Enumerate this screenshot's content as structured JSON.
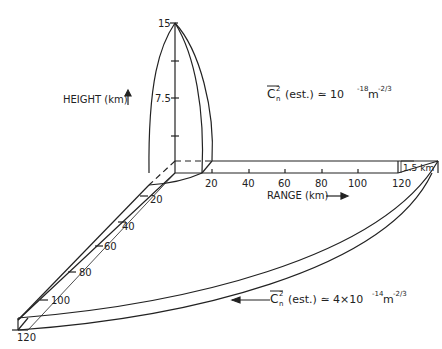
{
  "height_axis": {
    "label": "HEIGHT (km)",
    "ticks": [
      "15",
      "7.5"
    ]
  },
  "range_axis": {
    "label": "RANGE (km)",
    "ticks": [
      "20",
      "40",
      "60",
      "80",
      "100",
      "120"
    ]
  },
  "depth_axis": {
    "ticks": [
      "20",
      "40",
      "60",
      "80",
      "100",
      "120"
    ]
  },
  "layer_thickness": "1.5 km",
  "annotations": {
    "upper": {
      "symbol": "C",
      "sup": "2",
      "sub": "n",
      "text": "(est.) ≃ 10",
      "exp": "-18",
      "unit": "m",
      "unit_exp": "-2/3"
    },
    "lower": {
      "symbol": "C",
      "sup": "2",
      "sub": "n",
      "text": "(est.) ≃ 4×10",
      "exp": "-14",
      "unit": "m",
      "unit_exp": "-2/3"
    }
  },
  "colors": {
    "line": "#222222",
    "background": "#ffffff"
  }
}
